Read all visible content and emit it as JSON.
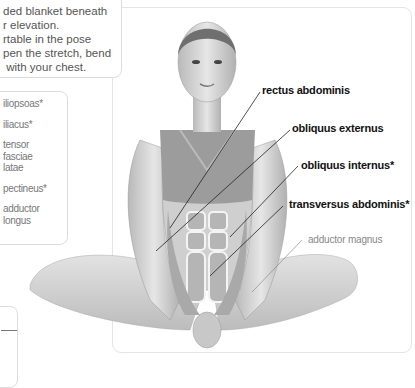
{
  "tip": {
    "lines": [
      "ded blanket beneath",
      "r elevation.",
      "rtable in the pose",
      "pen the stretch, bend",
      " with your chest."
    ]
  },
  "muscle_list": {
    "items": [
      "iliopsoas*",
      "iliacus*",
      "tensor fasciae latae",
      "pectineus*",
      "adductor longus"
    ]
  },
  "figure": {
    "labels": [
      {
        "text": "rectus abdominis",
        "style": "bold"
      },
      {
        "text": "obliquus externus",
        "style": "bold"
      },
      {
        "text": "obliquus internus*",
        "style": "bold"
      },
      {
        "text": "transversus abdominis*",
        "style": "bold"
      },
      {
        "text": "adductor magnus",
        "style": "light"
      }
    ]
  },
  "colors": {
    "panel_border": "#e4e4e4",
    "label_dark": "#111111",
    "label_light": "#888888",
    "muscle_fill": "#bdbdbd"
  }
}
